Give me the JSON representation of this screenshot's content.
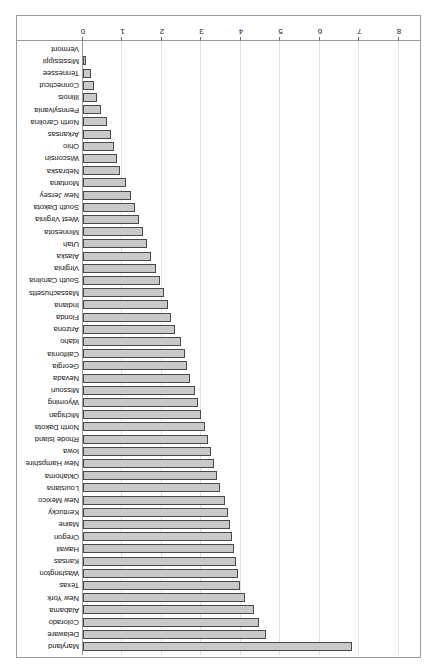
{
  "chart_data": {
    "type": "bar",
    "orientation": "horizontal",
    "title": "",
    "subtitle": "",
    "xlabel": "",
    "ylabel": "",
    "xlim": [
      0,
      8
    ],
    "grid": true,
    "legend": false,
    "rotation_degrees": 180,
    "xticks": [
      0,
      1,
      2,
      3,
      4,
      5,
      6,
      7,
      8
    ],
    "xtick_labels": [
      "0",
      "1",
      "2",
      "3",
      "4",
      "5",
      "6",
      "7",
      "8"
    ],
    "bar_face_color": "#c9c9c9",
    "bar_edge_color": "#4a4a4a",
    "grid_color": "#e2e2e2",
    "frame_color": "#9a9a9a",
    "categories": [
      "Maryland",
      "Delaware",
      "Colorado",
      "Alabama",
      "New York",
      "Texas",
      "Washington",
      "Kansas",
      "Hawaii",
      "Oregon",
      "Maine",
      "Kentucky",
      "New Mexico",
      "Louisiana",
      "Oklahoma",
      "New Hampshire",
      "Iowa",
      "Rhode Island",
      "North Dakota",
      "Michigan",
      "Wyoming",
      "Missouri",
      "Nevada",
      "Georgia",
      "California",
      "Idaho",
      "Arizona",
      "Florida",
      "Indiana",
      "Massachusetts",
      "South Carolina",
      "Virginia",
      "Alaska",
      "Utah",
      "Minnesota",
      "West Virginia",
      "South Dakota",
      "New Jersey",
      "Montana",
      "Nebraska",
      "Wisconsin",
      "Ohio",
      "Arkansas",
      "North Carolina",
      "Pennsylvania",
      "Illinois",
      "Connecticut",
      "Tennessee",
      "Mississippi",
      "Vermont"
    ],
    "values": [
      6.82,
      4.63,
      4.45,
      4.33,
      4.1,
      3.98,
      3.93,
      3.88,
      3.83,
      3.78,
      3.73,
      3.68,
      3.6,
      3.48,
      3.4,
      3.32,
      3.24,
      3.16,
      3.08,
      3.0,
      2.92,
      2.83,
      2.7,
      2.64,
      2.58,
      2.48,
      2.33,
      2.22,
      2.14,
      2.05,
      1.96,
      1.86,
      1.72,
      1.63,
      1.53,
      1.42,
      1.32,
      1.22,
      1.1,
      0.94,
      0.86,
      0.78,
      0.7,
      0.6,
      0.45,
      0.36,
      0.28,
      0.21,
      0.08,
      0.0
    ]
  }
}
